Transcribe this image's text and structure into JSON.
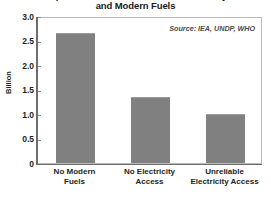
{
  "title": {
    "line_1": "Populations Without Access to Electricity",
    "line_2": "and Modern Fuels"
  },
  "source_note": "Source: IEA, UNDP, WHO",
  "axis": {
    "y_label": "Billion",
    "y_ticks": [
      "3.0",
      "2.5",
      "2.0",
      "1.5",
      "1.0",
      "0.5",
      "0"
    ]
  },
  "colors": {
    "bar_fill": "#808080",
    "axis_line": "#6d6d6d",
    "plot_border": "#b9b9b9",
    "text": "#231f20"
  },
  "chart_data": {
    "type": "bar",
    "title": "Populations Without Access to Electricity and Modern Fuels",
    "subtitle": "",
    "xlabel": "",
    "ylabel": "Billion",
    "ylim": [
      0,
      3.0
    ],
    "ytick_step": 0.5,
    "grid": false,
    "legend": false,
    "annotations": [
      "Source: IEA, UNDP, WHO"
    ],
    "categories": [
      "No Modern Fuels",
      "No Electricity Access",
      "Unreliable Electricity Access"
    ],
    "category_lines": [
      [
        "No Modern",
        "Fuels"
      ],
      [
        "No Electricity",
        "Access"
      ],
      [
        "Unreliable",
        "Electricity Access"
      ]
    ],
    "values": [
      2.66,
      1.34,
      1.0
    ],
    "units": "billion people"
  }
}
